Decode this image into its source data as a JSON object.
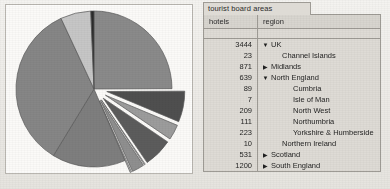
{
  "tab": {
    "label": "tourist board areas"
  },
  "table": {
    "columns": [
      "hotels",
      "region"
    ],
    "rows": [
      {
        "hotels": "3444",
        "region": "UK",
        "level": 0,
        "marker": "expanded",
        "marker_glyph": "▼"
      },
      {
        "hotels": "23",
        "region": "Channel Islands",
        "level": 1,
        "marker": "none",
        "marker_glyph": ""
      },
      {
        "hotels": "871",
        "region": "Midlands",
        "level": 0,
        "marker": "collapsed",
        "marker_glyph": "▶"
      },
      {
        "hotels": "639",
        "region": "North England",
        "level": 0,
        "marker": "expanded",
        "marker_glyph": "▼"
      },
      {
        "hotels": "89",
        "region": "Cumbria",
        "level": 2,
        "marker": "none",
        "marker_glyph": ""
      },
      {
        "hotels": "7",
        "region": "Isle of Man",
        "level": 2,
        "marker": "none",
        "marker_glyph": ""
      },
      {
        "hotels": "209",
        "region": "North West",
        "level": 2,
        "marker": "none",
        "marker_glyph": ""
      },
      {
        "hotels": "111",
        "region": "Northumbria",
        "level": 2,
        "marker": "none",
        "marker_glyph": ""
      },
      {
        "hotels": "223",
        "region": "Yorkshire & Humberside",
        "level": 2,
        "marker": "none",
        "marker_glyph": ""
      },
      {
        "hotels": "10",
        "region": "Northern Ireland",
        "level": 1,
        "marker": "none",
        "marker_glyph": ""
      },
      {
        "hotels": "531",
        "region": "Scotland",
        "level": 0,
        "marker": "collapsed",
        "marker_glyph": "▶"
      },
      {
        "hotels": "1200",
        "region": "South England",
        "level": 0,
        "marker": "collapsed",
        "marker_glyph": "▶"
      },
      {
        "hotels": "220",
        "region": "Wales",
        "level": 0,
        "marker": "collapsed",
        "marker_glyph": "▶"
      }
    ]
  },
  "chart_data": {
    "type": "pie",
    "title": "",
    "categories": [
      "Midlands",
      "North England: Yorkshire & Humberside",
      "North England: Northumbria",
      "North England: North West",
      "North England: Isle of Man",
      "North England: Cumbria",
      "Northern Ireland",
      "Scotland",
      "South England",
      "Wales",
      "Channel Islands"
    ],
    "values": [
      871,
      223,
      111,
      209,
      7,
      89,
      10,
      531,
      1200,
      220,
      23
    ],
    "total": 3444,
    "unit": "hotels",
    "exploded": [
      "North England: Yorkshire & Humberside",
      "North England: Northumbria",
      "North England: North West",
      "North England: Isle of Man",
      "North England: Cumbria",
      "Northern Ireland"
    ],
    "colors": [
      "#8a8a8a",
      "#4f4f4f",
      "#9c9c9c",
      "#5c5c5c",
      "#c9c9c9",
      "#8f8f8f",
      "#bdbdbd",
      "#7e7e7e",
      "#868686",
      "#c6c6c6",
      "#2a2a2a"
    ],
    "legend": "none",
    "grid": false,
    "start_angle_deg": 0
  },
  "colors": {
    "panel_bg": "#fbfaf8",
    "grid_bg": "#dedbd5",
    "border": "#9e9b95",
    "text": "#1f1f1f"
  }
}
